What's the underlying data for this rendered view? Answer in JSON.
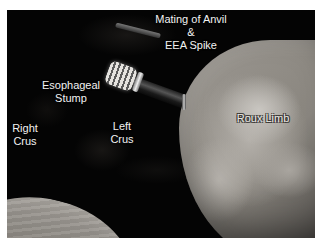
{
  "figure": {
    "background_color": "#ffffff",
    "photo_bg_color": "#050505"
  },
  "labels": {
    "mating": {
      "line1": "Mating of Anvil",
      "line2": "&",
      "line3": "EEA Spike"
    },
    "esophageal_stump": {
      "line1": "Esophageal",
      "line2": "Stump"
    },
    "right_crus": {
      "line1": "Right",
      "line2": "Crus"
    },
    "left_crus": {
      "line1": "Left",
      "line2": "Crus"
    },
    "roux_limb": "Roux Limb"
  }
}
